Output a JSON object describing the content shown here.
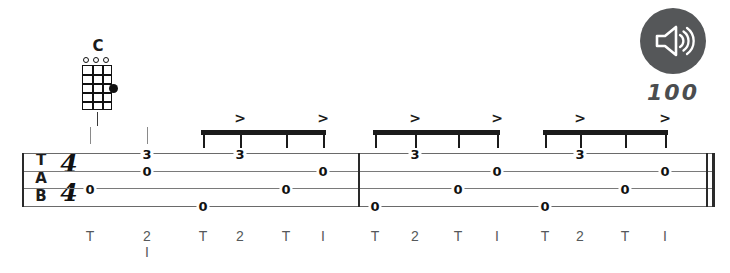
{
  "chord": {
    "name": "C",
    "strings": 4,
    "frets": 5,
    "open_strings": [
      1,
      2,
      3
    ],
    "fingered": [
      {
        "string": 4,
        "fret": 3
      }
    ],
    "stem_icon": "chord-stem"
  },
  "tempo": {
    "value": "100",
    "speaker_icon": "speaker-icon",
    "button_color": "#555759"
  },
  "staff": {
    "clef": [
      "T",
      "A",
      "B"
    ],
    "time_signature": {
      "top": "4",
      "bottom": "4"
    },
    "lines": 4,
    "notes": [
      {
        "x": 90,
        "line": 3,
        "fret": "0"
      },
      {
        "x": 147,
        "line": 1,
        "fret": "3"
      },
      {
        "x": 147,
        "line": 2,
        "fret": "0"
      },
      {
        "x": 203,
        "line": 4,
        "fret": "0"
      },
      {
        "x": 240,
        "line": 1,
        "fret": "3"
      },
      {
        "x": 286,
        "line": 3,
        "fret": "0"
      },
      {
        "x": 323,
        "line": 2,
        "fret": "0"
      },
      {
        "x": 375,
        "line": 4,
        "fret": "0"
      },
      {
        "x": 415,
        "line": 1,
        "fret": "3"
      },
      {
        "x": 458,
        "line": 3,
        "fret": "0"
      },
      {
        "x": 497,
        "line": 2,
        "fret": "0"
      },
      {
        "x": 545,
        "line": 4,
        "fret": "0"
      },
      {
        "x": 580,
        "line": 1,
        "fret": "3"
      },
      {
        "x": 625,
        "line": 3,
        "fret": "0"
      },
      {
        "x": 665,
        "line": 2,
        "fret": "0"
      }
    ],
    "barlines": [
      {
        "x": 358,
        "type": "single"
      },
      {
        "x": 706,
        "type": "final-thin"
      },
      {
        "x": 712,
        "type": "final-thick"
      }
    ],
    "beam_groups": [
      {
        "start": 201,
        "end": 326,
        "stems": [
          203,
          240,
          286,
          323
        ],
        "accents": [
          240,
          323
        ]
      },
      {
        "start": 373,
        "end": 500,
        "stems": [
          375,
          415,
          458,
          497
        ],
        "accents": [
          415,
          497
        ]
      },
      {
        "start": 543,
        "end": 668,
        "stems": [
          545,
          580,
          625,
          665
        ],
        "accents": [
          580,
          665
        ]
      }
    ],
    "pickup_stems": [
      90,
      147
    ]
  },
  "fingering": {
    "accent_symbol": ">",
    "marks": [
      {
        "x": 90,
        "label": "T",
        "sub": ""
      },
      {
        "x": 147,
        "label": "2",
        "sub": "I"
      },
      {
        "x": 203,
        "label": "T",
        "sub": ""
      },
      {
        "x": 240,
        "label": "2",
        "sub": ""
      },
      {
        "x": 286,
        "label": "T",
        "sub": ""
      },
      {
        "x": 323,
        "label": "I",
        "sub": ""
      },
      {
        "x": 375,
        "label": "T",
        "sub": ""
      },
      {
        "x": 415,
        "label": "2",
        "sub": ""
      },
      {
        "x": 458,
        "label": "T",
        "sub": ""
      },
      {
        "x": 497,
        "label": "I",
        "sub": ""
      },
      {
        "x": 545,
        "label": "T",
        "sub": ""
      },
      {
        "x": 580,
        "label": "2",
        "sub": ""
      },
      {
        "x": 625,
        "label": "T",
        "sub": ""
      },
      {
        "x": 665,
        "label": "I",
        "sub": ""
      }
    ]
  }
}
